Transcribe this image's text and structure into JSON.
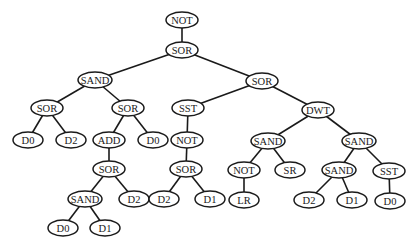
{
  "diagram": {
    "type": "tree",
    "node_rx": 16,
    "node_ry": 8,
    "nodes": [
      {
        "id": "n1",
        "label": "NOT",
        "x": 182,
        "y": 20
      },
      {
        "id": "n2",
        "label": "SOR",
        "x": 182,
        "y": 50
      },
      {
        "id": "n3",
        "label": "SAND",
        "x": 95,
        "y": 80
      },
      {
        "id": "n4",
        "label": "SOR",
        "x": 262,
        "y": 81
      },
      {
        "id": "n5",
        "label": "SOR",
        "x": 47,
        "y": 108
      },
      {
        "id": "n6",
        "label": "SOR",
        "x": 128,
        "y": 108
      },
      {
        "id": "n7",
        "label": "SST",
        "x": 188,
        "y": 108
      },
      {
        "id": "n8",
        "label": "DWT",
        "x": 318,
        "y": 110
      },
      {
        "id": "n9",
        "label": "D0",
        "x": 28,
        "y": 140
      },
      {
        "id": "n10",
        "label": "D2",
        "x": 71,
        "y": 140
      },
      {
        "id": "n11",
        "label": "ADD",
        "x": 109,
        "y": 140
      },
      {
        "id": "n12",
        "label": "D0",
        "x": 153,
        "y": 140
      },
      {
        "id": "n13",
        "label": "NOT",
        "x": 187,
        "y": 140
      },
      {
        "id": "n14",
        "label": "SAND",
        "x": 268,
        "y": 141
      },
      {
        "id": "n15",
        "label": "SAND",
        "x": 359,
        "y": 141
      },
      {
        "id": "n16",
        "label": "SOR",
        "x": 109,
        "y": 169
      },
      {
        "id": "n17",
        "label": "SOR",
        "x": 186,
        "y": 169
      },
      {
        "id": "n18",
        "label": "NOT",
        "x": 244,
        "y": 170
      },
      {
        "id": "n19",
        "label": "SR",
        "x": 290,
        "y": 170
      },
      {
        "id": "n20",
        "label": "SAND",
        "x": 339,
        "y": 170
      },
      {
        "id": "n21",
        "label": "SST",
        "x": 389,
        "y": 171
      },
      {
        "id": "n22",
        "label": "SAND",
        "x": 85,
        "y": 199
      },
      {
        "id": "n23",
        "label": "D2",
        "x": 134,
        "y": 199
      },
      {
        "id": "n24",
        "label": "D2",
        "x": 164,
        "y": 199
      },
      {
        "id": "n25",
        "label": "D1",
        "x": 210,
        "y": 199
      },
      {
        "id": "n26",
        "label": "LR",
        "x": 244,
        "y": 200
      },
      {
        "id": "n27",
        "label": "D2",
        "x": 309,
        "y": 200
      },
      {
        "id": "n28",
        "label": "D1",
        "x": 352,
        "y": 200
      },
      {
        "id": "n29",
        "label": "D0",
        "x": 390,
        "y": 201
      },
      {
        "id": "n30",
        "label": "D0",
        "x": 63,
        "y": 228
      },
      {
        "id": "n31",
        "label": "D1",
        "x": 105,
        "y": 228
      }
    ],
    "edges": [
      [
        "n1",
        "n2"
      ],
      [
        "n2",
        "n3"
      ],
      [
        "n2",
        "n4"
      ],
      [
        "n3",
        "n5"
      ],
      [
        "n3",
        "n6"
      ],
      [
        "n4",
        "n7"
      ],
      [
        "n4",
        "n8"
      ],
      [
        "n5",
        "n9"
      ],
      [
        "n5",
        "n10"
      ],
      [
        "n6",
        "n11"
      ],
      [
        "n6",
        "n12"
      ],
      [
        "n7",
        "n13"
      ],
      [
        "n8",
        "n14"
      ],
      [
        "n8",
        "n15"
      ],
      [
        "n11",
        "n16"
      ],
      [
        "n13",
        "n17"
      ],
      [
        "n14",
        "n18"
      ],
      [
        "n14",
        "n19"
      ],
      [
        "n15",
        "n20"
      ],
      [
        "n15",
        "n21"
      ],
      [
        "n16",
        "n22"
      ],
      [
        "n16",
        "n23"
      ],
      [
        "n17",
        "n24"
      ],
      [
        "n17",
        "n25"
      ],
      [
        "n18",
        "n26"
      ],
      [
        "n20",
        "n27"
      ],
      [
        "n20",
        "n28"
      ],
      [
        "n21",
        "n29"
      ],
      [
        "n22",
        "n30"
      ],
      [
        "n22",
        "n31"
      ]
    ]
  }
}
